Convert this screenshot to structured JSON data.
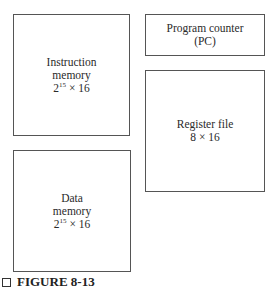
{
  "diagram": {
    "blocks": [
      {
        "id": "instruction-memory",
        "lines": [
          "Instruction",
          "memory"
        ],
        "size": {
          "base": "2",
          "exp": "15",
          "rest": " × 16"
        }
      },
      {
        "id": "program-counter",
        "lines": [
          "Program counter",
          "(PC)"
        ]
      },
      {
        "id": "register-file",
        "lines": [
          "Register file",
          "8 × 16"
        ]
      },
      {
        "id": "data-memory",
        "lines": [
          "Data",
          "memory"
        ],
        "size": {
          "base": "2",
          "exp": "15",
          "rest": " × 16"
        }
      }
    ]
  },
  "caption": {
    "label": "FIGURE 8-13"
  }
}
